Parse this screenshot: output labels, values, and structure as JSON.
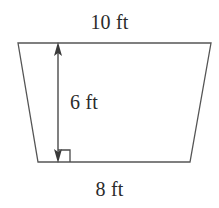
{
  "figure": {
    "kind": "geometry-diagram",
    "shape_name": "trapezoid",
    "background_color": "#ffffff",
    "stroke_color": "#555555",
    "text_color": "#2b2b2b",
    "labels": {
      "top_base": "10 ft",
      "bottom_base": "8 ft",
      "height": "6 ft"
    },
    "annotations": {
      "right_angle_marker": "right-angle-marker",
      "height_arrow": "double-headed-vertical-arrow"
    },
    "geometry": {
      "top_left": [
        18,
        43
      ],
      "top_right": [
        211,
        43
      ],
      "bottom_right": [
        190,
        162
      ],
      "bottom_left": [
        38,
        162
      ],
      "height_line_x": 58,
      "height_line_top_y": 43,
      "height_line_bottom_y": 162,
      "right_angle_size": 12
    },
    "measurements": {
      "top_base_value": 10,
      "bottom_base_value": 8,
      "height_value": 6,
      "units": "ft"
    }
  }
}
